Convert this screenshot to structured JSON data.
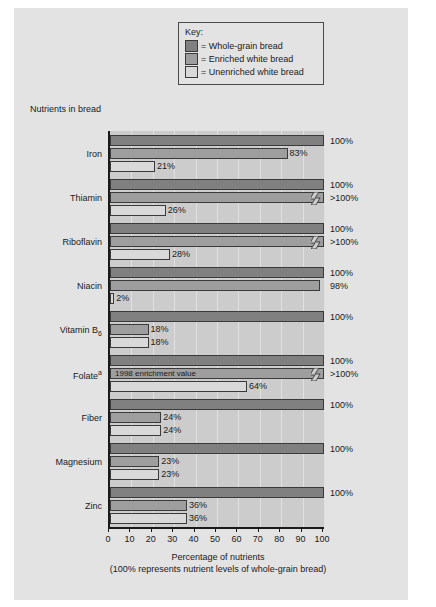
{
  "legend": {
    "title": "Key:",
    "items": [
      {
        "label": "= Whole-grain bread",
        "color": "#808080"
      },
      {
        "label": "= Enriched white bread",
        "color": "#9e9e9e"
      },
      {
        "label": "= Unenriched white bread",
        "color": "#d9d9d9"
      }
    ]
  },
  "chart_data": {
    "type": "bar",
    "orientation": "horizontal",
    "title": "Nutrients in bread",
    "xlabel_line1": "Percentage of nutrients",
    "xlabel_line2": "(100% represents nutrient levels of whole-grain bread)",
    "ylabel": "",
    "xlim": [
      0,
      100
    ],
    "grid": true,
    "legend_position": "top-center",
    "ticks": [
      0,
      10,
      20,
      30,
      40,
      50,
      60,
      70,
      80,
      90,
      100
    ],
    "tick_labels": [
      "0",
      "10",
      "20",
      "30",
      "40",
      "50",
      "60",
      "70",
      "80",
      "90",
      "100"
    ],
    "categories": [
      "Iron",
      "Thiamin",
      "Riboflavin",
      "Niacin",
      "Vitamin B6",
      "Folate",
      "Fiber",
      "Magnesium",
      "Zinc"
    ],
    "category_labels_html": [
      "Iron",
      "Thiamin",
      "Riboflavin",
      "Niacin",
      "Vitamin B<sub>6</sub>",
      "Folate<sup>a</sup>",
      "Fiber",
      "Magnesium",
      "Zinc"
    ],
    "series": [
      {
        "name": "Whole-grain bread",
        "color": "#808080",
        "values": [
          100,
          100,
          100,
          100,
          100,
          100,
          100,
          100,
          100
        ],
        "labels": [
          "100%",
          "100%",
          "100%",
          "100%",
          "100%",
          "100%",
          "100%",
          "100%",
          "100%"
        ]
      },
      {
        "name": "Enriched white bread",
        "color": "#9e9e9e",
        "values": [
          83,
          100,
          100,
          98,
          18,
          100,
          24,
          23,
          36
        ],
        "labels": [
          "83%",
          ">100%",
          ">100%",
          "98%",
          "18%",
          ">100%",
          "24%",
          "23%",
          "36%"
        ],
        "truncated": [
          false,
          true,
          true,
          false,
          false,
          true,
          false,
          false,
          false
        ],
        "inline_notes": [
          "",
          "",
          "",
          "",
          "",
          "1998 enrichment value",
          "",
          "",
          ""
        ]
      },
      {
        "name": "Unenriched white bread",
        "color": "#d9d9d9",
        "values": [
          21,
          26,
          28,
          2,
          18,
          64,
          24,
          23,
          36
        ],
        "labels": [
          "21%",
          "26%",
          "28%",
          "2%",
          "18%",
          "64%",
          "24%",
          "23%",
          "36%"
        ]
      }
    ]
  }
}
